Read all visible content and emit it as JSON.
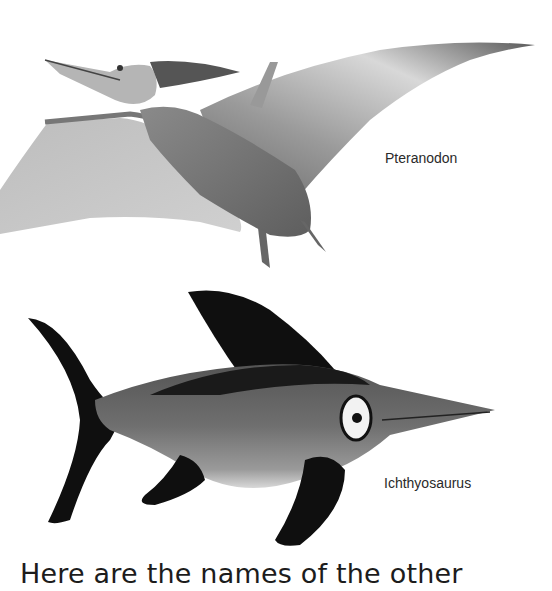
{
  "page": {
    "illustrations": [
      {
        "name": "Pteranodon",
        "label": "Pteranodon"
      },
      {
        "name": "Ichthyosaurus",
        "label": "Ichthyosaurus"
      }
    ],
    "body_text": "Here are the names of the other"
  }
}
